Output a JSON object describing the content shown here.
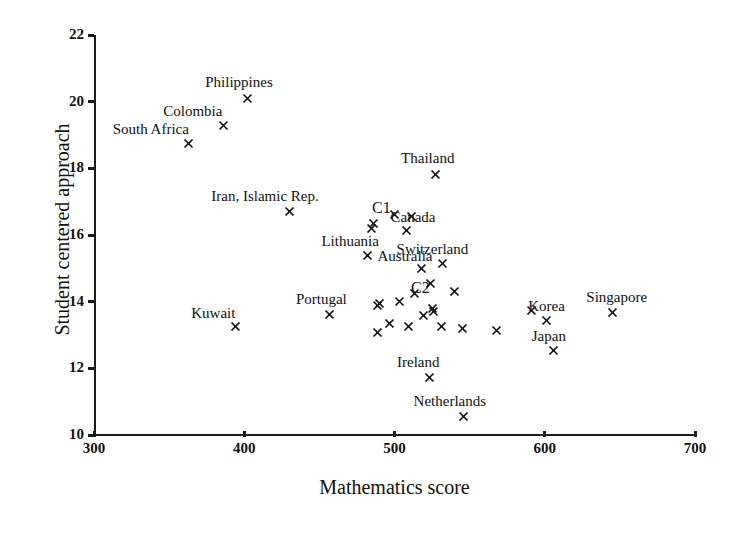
{
  "chart_data": {
    "type": "scatter",
    "title": "",
    "xlabel": "Mathematics score",
    "ylabel": "Student centered approach",
    "xlim": [
      300,
      700
    ],
    "ylim": [
      10,
      22
    ],
    "xticks": [
      300,
      400,
      500,
      600,
      700
    ],
    "yticks": [
      10,
      12,
      14,
      16,
      18,
      20,
      22
    ],
    "grid": false,
    "legend": "none",
    "marker": "x",
    "points": [
      {
        "label": "South Africa",
        "x": 363,
        "y": 18.75,
        "label_dx": -76,
        "label_dy": -22
      },
      {
        "label": "Colombia",
        "x": 386,
        "y": 19.3,
        "label_dx": -60,
        "label_dy": -22
      },
      {
        "label": "Philippines",
        "x": 402,
        "y": 20.1,
        "label_dx": -42,
        "label_dy": -24
      },
      {
        "label": "Thailand",
        "x": 527,
        "y": 17.83,
        "label_dx": -34,
        "label_dy": -24
      },
      {
        "label": "Iran, Islamic Rep.",
        "x": 430,
        "y": 16.72,
        "label_dx": -78,
        "label_dy": -23
      },
      {
        "label": "",
        "x": 485,
        "y": 16.2,
        "label_dx": 0,
        "label_dy": 0
      },
      {
        "label": "",
        "x": 486,
        "y": 16.35,
        "label_dx": 0,
        "label_dy": 0
      },
      {
        "label": "",
        "x": 500,
        "y": 16.62,
        "label_dx": 0,
        "label_dy": 0
      },
      {
        "label": "",
        "x": 511,
        "y": 16.57,
        "label_dx": 0,
        "label_dy": 0
      },
      {
        "label": "Canada",
        "x": 508,
        "y": 16.15,
        "label_dx": -16,
        "label_dy": -21
      },
      {
        "label": "Lithuania",
        "x": 482,
        "y": 15.4,
        "label_dx": -46,
        "label_dy": -22
      },
      {
        "label": "Switzerland",
        "x": 532,
        "y": 15.15,
        "label_dx": -46,
        "label_dy": -22
      },
      {
        "label": "Australia",
        "x": 518,
        "y": 15.0,
        "label_dx": -44,
        "label_dy": -20
      },
      {
        "label": "",
        "x": 524,
        "y": 14.55,
        "label_dx": 0,
        "label_dy": 0
      },
      {
        "label": "",
        "x": 540,
        "y": 14.3,
        "label_dx": 0,
        "label_dy": 0
      },
      {
        "label": "",
        "x": 513,
        "y": 14.25,
        "label_dx": 0,
        "label_dy": 0
      },
      {
        "label": "",
        "x": 503,
        "y": 14.0,
        "label_dx": 0,
        "label_dy": 0
      },
      {
        "label": "",
        "x": 490,
        "y": 13.95,
        "label_dx": 0,
        "label_dy": 0
      },
      {
        "label": "Kuwait",
        "x": 394,
        "y": 13.25,
        "label_dx": -44,
        "label_dy": -22
      },
      {
        "label": "Portugal",
        "x": 457,
        "y": 13.62,
        "label_dx": -34,
        "label_dy": -23
      },
      {
        "label": "",
        "x": 489,
        "y": 13.9,
        "label_dx": 0,
        "label_dy": 0
      },
      {
        "label": "",
        "x": 489,
        "y": 13.08,
        "label_dx": 0,
        "label_dy": 0
      },
      {
        "label": "",
        "x": 497,
        "y": 13.35,
        "label_dx": 0,
        "label_dy": 0
      },
      {
        "label": "",
        "x": 509,
        "y": 13.25,
        "label_dx": 0,
        "label_dy": 0
      },
      {
        "label": "",
        "x": 519,
        "y": 13.6,
        "label_dx": 0,
        "label_dy": 0
      },
      {
        "label": "",
        "x": 525,
        "y": 13.8,
        "label_dx": 0,
        "label_dy": 0
      },
      {
        "label": "",
        "x": 526,
        "y": 13.7,
        "label_dx": 0,
        "label_dy": 0
      },
      {
        "label": "",
        "x": 531,
        "y": 13.25,
        "label_dx": 0,
        "label_dy": 0
      },
      {
        "label": "",
        "x": 545,
        "y": 13.2,
        "label_dx": 0,
        "label_dy": 0
      },
      {
        "label": "",
        "x": 568,
        "y": 13.15,
        "label_dx": 0,
        "label_dy": 0
      },
      {
        "label": "",
        "x": 591,
        "y": 13.75,
        "label_dx": 0,
        "label_dy": 0
      },
      {
        "label": "Korea",
        "x": 601,
        "y": 13.45,
        "label_dx": -18,
        "label_dy": -22
      },
      {
        "label": "Singapore",
        "x": 645,
        "y": 13.68,
        "label_dx": -26,
        "label_dy": -23
      },
      {
        "label": "Japan",
        "x": 606,
        "y": 12.55,
        "label_dx": -22,
        "label_dy": -22
      },
      {
        "label": "Ireland",
        "x": 523,
        "y": 11.72,
        "label_dx": -32,
        "label_dy": -24
      },
      {
        "label": "Netherlands",
        "x": 546,
        "y": 10.55,
        "label_dx": -50,
        "label_dy": -24
      }
    ],
    "cluster_annotations": [
      {
        "label": "C1",
        "x": 497,
        "y": 16.8
      },
      {
        "label": "C2",
        "x": 523,
        "y": 14.4
      }
    ]
  }
}
